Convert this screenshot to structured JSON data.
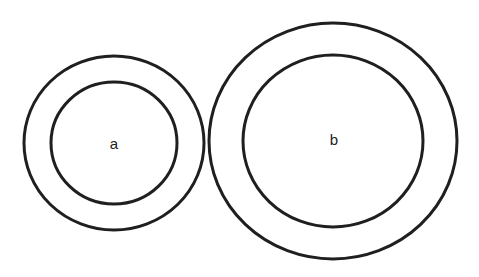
{
  "diagram": {
    "stroke_color": "#1f1f1f",
    "background": "#ffffff",
    "circles": [
      {
        "label": "a",
        "center": [
          114,
          143
        ],
        "outer": {
          "rx": 90,
          "ry": 87
        },
        "inner": {
          "rx": 63,
          "ry": 61
        }
      },
      {
        "label": "b",
        "center": [
          333,
          141
        ],
        "outer": {
          "rx": 124,
          "ry": 118
        },
        "inner": {
          "rx": 90,
          "ry": 86
        }
      }
    ]
  }
}
